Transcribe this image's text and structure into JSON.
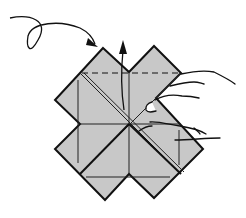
{
  "illustration": {
    "subject": "origami folding step",
    "paper_color": "#c8c8c8",
    "line_color": "#111111",
    "background": "#ffffff",
    "steps": [
      {
        "name": "turn-over-arrow",
        "meaning": "turn model over"
      },
      {
        "name": "fold-up-arrow",
        "meaning": "fold flap upward along dashed line"
      },
      {
        "name": "valley-fold-line",
        "style": "dashed"
      }
    ]
  }
}
